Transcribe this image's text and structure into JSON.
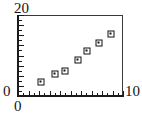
{
  "chart_data": {
    "type": "scatter",
    "title": "",
    "xlabel": "",
    "ylabel": "",
    "xlim": [
      0,
      10
    ],
    "ylim": [
      0,
      20
    ],
    "grid": false,
    "legend": null,
    "x": [
      2.2,
      3.5,
      4.5,
      5.7,
      6.6,
      7.7,
      8.9
    ],
    "y": [
      3.5,
      5.4,
      6.2,
      8.9,
      11.1,
      13.1,
      15.3
    ],
    "points": [
      {
        "x": 2.2,
        "y": 3.5
      },
      {
        "x": 3.5,
        "y": 5.4
      },
      {
        "x": 4.5,
        "y": 6.2
      },
      {
        "x": 5.7,
        "y": 8.9
      },
      {
        "x": 6.6,
        "y": 11.1
      },
      {
        "x": 7.7,
        "y": 13.1
      },
      {
        "x": 8.9,
        "y": 15.3
      }
    ],
    "marker": "open-square-with-dot",
    "marker_color": "#111111",
    "x_ticks_major": [
      0,
      1,
      2,
      3,
      4,
      5,
      6,
      7,
      8,
      9,
      10
    ],
    "x_ticks_minor": [
      0.5,
      1.5,
      2.5,
      3.5,
      4.5,
      5.5,
      6.5,
      7.5,
      8.5,
      9.5
    ],
    "y_ticks_major": [
      0,
      2.5,
      5,
      7.5,
      10,
      12.5,
      15,
      17.5,
      20
    ],
    "y_ticks_minor": [
      1.25,
      3.75,
      6.25,
      8.75,
      11.25,
      13.75,
      16.25,
      18.75
    ],
    "x_tick_labels": [
      "0",
      "10"
    ],
    "y_tick_labels": [
      "0",
      "20"
    ]
  },
  "labels": {
    "y_max": "20",
    "y_origin": "0",
    "x_origin": "0",
    "x_max": "10"
  },
  "colors": {
    "axis": "#1a1a1a",
    "frame": "#3a3a3a",
    "marker": "#111111",
    "background": "#ffffff"
  }
}
